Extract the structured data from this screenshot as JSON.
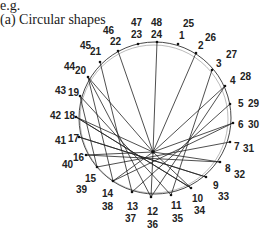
{
  "caption": {
    "eg": "e.g.",
    "title": "(a)  Circular shapes"
  },
  "figure": {
    "center": [
      155,
      118
    ],
    "radius": 76,
    "apex": [
      153,
      152
    ],
    "points": [
      {
        "inner": "1",
        "outer": "25",
        "pos": [
          178,
          44
        ]
      },
      {
        "inner": "2",
        "outer": "26",
        "pos": [
          196,
          53
        ]
      },
      {
        "inner": "3",
        "outer": "27",
        "pos": [
          212,
          70
        ]
      },
      {
        "inner": "4",
        "outer": "28",
        "pos": [
          225,
          86
        ]
      },
      {
        "inner": "5",
        "outer": "29",
        "pos": [
          230,
          104
        ]
      },
      {
        "inner": "6",
        "outer": "30",
        "pos": [
          233,
          123
        ]
      },
      {
        "inner": "7",
        "outer": "31",
        "pos": [
          230,
          142
        ]
      },
      {
        "inner": "8",
        "outer": "32",
        "pos": [
          220,
          162
        ]
      },
      {
        "inner": "9",
        "outer": "33",
        "pos": [
          206,
          177
        ]
      },
      {
        "inner": "10",
        "outer": "34",
        "pos": [
          191,
          188
        ]
      },
      {
        "inner": "11",
        "outer": "35",
        "pos": [
          171,
          195
        ]
      },
      {
        "inner": "12",
        "outer": "36",
        "pos": [
          151,
          197
        ]
      },
      {
        "inner": "13",
        "outer": "37",
        "pos": [
          132,
          192
        ]
      },
      {
        "inner": "14",
        "outer": "38",
        "pos": [
          113,
          181
        ]
      },
      {
        "inner": "15",
        "outer": "39",
        "pos": [
          97,
          167
        ]
      },
      {
        "inner": "16",
        "outer": "40",
        "pos": [
          86,
          155
        ]
      },
      {
        "inner": "17",
        "outer": "41",
        "pos": [
          79,
          137
        ]
      },
      {
        "inner": "18",
        "outer": "42",
        "pos": [
          76,
          117
        ]
      },
      {
        "inner": "19",
        "outer": "43",
        "pos": [
          80,
          96
        ]
      },
      {
        "inner": "20",
        "outer": "44",
        "pos": [
          88,
          77
        ]
      },
      {
        "inner": "21",
        "outer": "45",
        "pos": [
          100,
          62
        ]
      },
      {
        "inner": "22",
        "outer": "46",
        "pos": [
          118,
          51
        ]
      },
      {
        "inner": "23",
        "outer": "47",
        "pos": [
          138,
          44
        ]
      },
      {
        "inner": "24",
        "outer": "48",
        "pos": [
          157,
          42
        ]
      }
    ],
    "labels": [
      {
        "text": "48",
        "x": 151,
        "y": 26
      },
      {
        "text": "24",
        "x": 151,
        "y": 38
      },
      {
        "text": "47",
        "x": 131,
        "y": 26
      },
      {
        "text": "23",
        "x": 131,
        "y": 38
      },
      {
        "text": "46",
        "x": 103,
        "y": 34
      },
      {
        "text": "22",
        "x": 110,
        "y": 45
      },
      {
        "text": "45",
        "x": 80,
        "y": 49
      },
      {
        "text": "21",
        "x": 90,
        "y": 55
      },
      {
        "text": "44",
        "x": 64,
        "y": 70
      },
      {
        "text": "20",
        "x": 75,
        "y": 74
      },
      {
        "text": "43",
        "x": 55,
        "y": 94
      },
      {
        "text": "19",
        "x": 68,
        "y": 96
      },
      {
        "text": "42",
        "x": 50,
        "y": 119
      },
      {
        "text": "18",
        "x": 64,
        "y": 119
      },
      {
        "text": "41",
        "x": 55,
        "y": 144
      },
      {
        "text": "17",
        "x": 68,
        "y": 142
      },
      {
        "text": "40",
        "x": 62,
        "y": 168
      },
      {
        "text": "16",
        "x": 73,
        "y": 161
      },
      {
        "text": "15",
        "x": 85,
        "y": 182
      },
      {
        "text": "39",
        "x": 76,
        "y": 193
      },
      {
        "text": "14",
        "x": 102,
        "y": 197
      },
      {
        "text": "38",
        "x": 102,
        "y": 210
      },
      {
        "text": "13",
        "x": 127,
        "y": 210
      },
      {
        "text": "37",
        "x": 125,
        "y": 222
      },
      {
        "text": "12",
        "x": 147,
        "y": 215
      },
      {
        "text": "36",
        "x": 147,
        "y": 228
      },
      {
        "text": "11",
        "x": 171,
        "y": 209
      },
      {
        "text": "35",
        "x": 172,
        "y": 222
      },
      {
        "text": "10",
        "x": 192,
        "y": 202
      },
      {
        "text": "34",
        "x": 194,
        "y": 214
      },
      {
        "text": "9",
        "x": 213,
        "y": 189
      },
      {
        "text": "33",
        "x": 218,
        "y": 200
      },
      {
        "text": "8",
        "x": 225,
        "y": 172
      },
      {
        "text": "32",
        "x": 234,
        "y": 178
      },
      {
        "text": "7",
        "x": 234,
        "y": 150
      },
      {
        "text": "31",
        "x": 243,
        "y": 152
      },
      {
        "text": "6",
        "x": 238,
        "y": 128
      },
      {
        "text": "30",
        "x": 248,
        "y": 128
      },
      {
        "text": "5",
        "x": 238,
        "y": 107
      },
      {
        "text": "29",
        "x": 248,
        "y": 107
      },
      {
        "text": "4",
        "x": 230,
        "y": 84
      },
      {
        "text": "28",
        "x": 240,
        "y": 80
      },
      {
        "text": "3",
        "x": 216,
        "y": 67
      },
      {
        "text": "27",
        "x": 226,
        "y": 58
      },
      {
        "text": "2",
        "x": 198,
        "y": 49
      },
      {
        "text": "26",
        "x": 205,
        "y": 41
      },
      {
        "text": "1",
        "x": 179,
        "y": 39
      },
      {
        "text": "25",
        "x": 183,
        "y": 27
      }
    ],
    "apex_chords_from": [
      "24",
      "22",
      "20",
      "18",
      "2",
      "4",
      "6",
      "10",
      "12",
      "14",
      "8",
      "16"
    ],
    "cross_chords": [
      [
        "16",
        "8"
      ],
      [
        "17",
        "9"
      ],
      [
        "18",
        "10"
      ],
      [
        "15",
        "7"
      ],
      [
        "14",
        "6"
      ],
      [
        "13",
        "5"
      ],
      [
        "12",
        "4"
      ],
      [
        "11",
        "19"
      ],
      [
        "10",
        "18"
      ],
      [
        "9",
        "17"
      ],
      [
        "14",
        "20"
      ],
      [
        "12",
        "20"
      ],
      [
        "13",
        "21"
      ],
      [
        "11",
        "3"
      ],
      [
        "15",
        "19"
      ]
    ]
  }
}
